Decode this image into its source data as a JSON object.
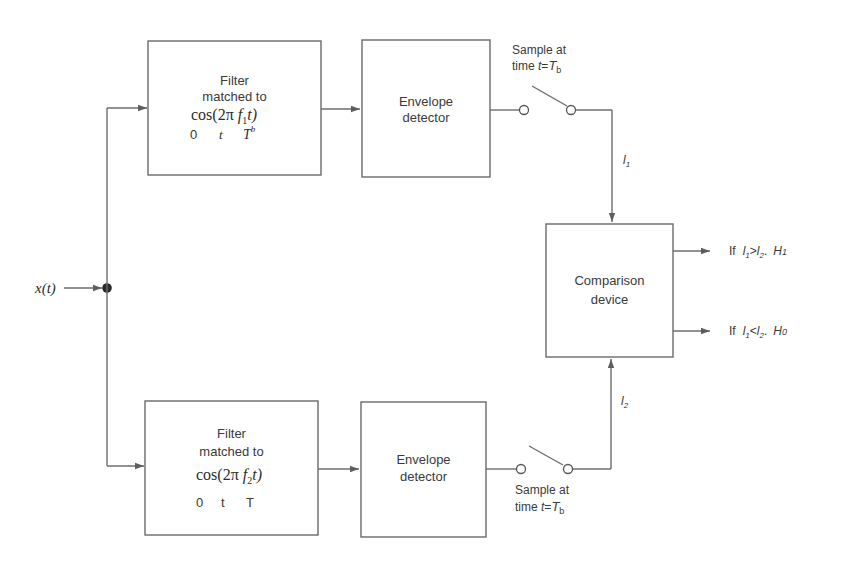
{
  "diagram": {
    "input": {
      "label": "x(t)"
    },
    "branches": [
      {
        "id": "upper",
        "filter": {
          "line1": "Filter",
          "line2": "matched to",
          "formula_prefix": "cos(2π ",
          "formula_var": "f",
          "formula_sub": "1",
          "formula_suffix": "t)",
          "range_a": "0",
          "range_b": "t",
          "range_c": "T",
          "range_c_sup": "b"
        },
        "envelope": {
          "line1": "Envelope",
          "line2": "detector"
        },
        "sampler": {
          "line1": "Sample at",
          "line2_prefix": "time ",
          "line2_var": "t",
          "line2_eq": "=",
          "line2_T": "T",
          "line2_sub": "b"
        },
        "output_label": {
          "var": "l",
          "sub": "1"
        }
      },
      {
        "id": "lower",
        "filter": {
          "line1": "Filter",
          "line2": "matched to",
          "formula_prefix": "cos(2π ",
          "formula_var": "f",
          "formula_sub": "2",
          "formula_suffix": "t)",
          "range_a": "0",
          "range_b": "t",
          "range_c": "T"
        },
        "envelope": {
          "line1": "Envelope",
          "line2": "detector"
        },
        "sampler": {
          "line1": "Sample at",
          "line2_prefix": "time ",
          "line2_var": "t",
          "line2_eq": "=",
          "line2_T": "T",
          "line2_sub": "b"
        },
        "output_label": {
          "var": "l",
          "sub": "2"
        }
      }
    ],
    "comparison": {
      "line1": "Comparison",
      "line2": "device"
    },
    "decisions": [
      {
        "if": "If",
        "l_a": "l",
        "sub_a": "1",
        "op": ">",
        "l_b": "l",
        "sub_b": "2",
        "sep": ".",
        "h": "H",
        "h_sub": "1"
      },
      {
        "if": "If",
        "l_a": "l",
        "sub_a": "1",
        "op": "<",
        "l_b": "l",
        "sub_b": "2",
        "sep": ".",
        "h": "H",
        "h_sub": "0"
      }
    ],
    "colors": {
      "line": "#6e6e6e",
      "text": "#3a3a3a",
      "background": "#ffffff"
    }
  }
}
